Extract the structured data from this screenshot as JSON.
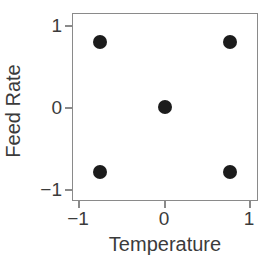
{
  "chart_data": {
    "type": "scatter",
    "title": "",
    "xlabel": "Temperature",
    "ylabel": "Feed Rate",
    "xlim": [
      -1.42,
      1.42
    ],
    "ylim": [
      -1.42,
      1.42
    ],
    "grid": false,
    "legend": null,
    "xticks": [
      {
        "value": -1,
        "label": "−1"
      },
      {
        "value": 0,
        "label": "0"
      },
      {
        "value": 1,
        "label": "1"
      }
    ],
    "yticks": [
      {
        "value": -1,
        "label": "−1"
      },
      {
        "value": 0,
        "label": "0"
      },
      {
        "value": 1,
        "label": "1"
      }
    ],
    "series": [
      {
        "name": "Design points",
        "marker": "filled-circle",
        "marker_color": "#1c1c1c",
        "marker_size_px": 14,
        "points": [
          {
            "x": -1,
            "y": 1
          },
          {
            "x": 1,
            "y": 1
          },
          {
            "x": 0,
            "y": 0
          },
          {
            "x": -1,
            "y": -1
          },
          {
            "x": 1,
            "y": -1
          }
        ]
      }
    ]
  },
  "style": {
    "background": "#ffffff",
    "axis_color": "#8a8a8a",
    "text_color": "#3b3b3b",
    "marker_color": "#1c1c1c"
  }
}
